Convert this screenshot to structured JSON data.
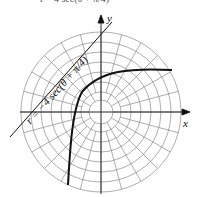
{
  "top_text": "r = 4 sec(θ + π/4)",
  "equation_label": "r = −4 sec(θ + π/4)",
  "axes": {
    "x_label": "x",
    "y_label": "y"
  },
  "polar_grid": {
    "rings": 8,
    "spokes": 24,
    "colors": {
      "grid": "#888888",
      "curve": "#111111"
    }
  }
}
